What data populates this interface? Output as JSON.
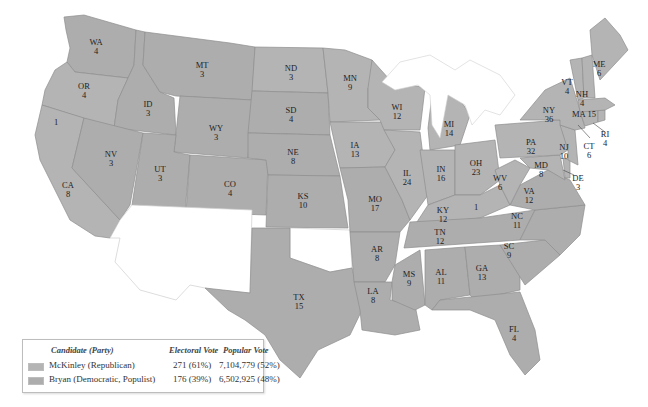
{
  "map": {
    "title": "1896 Presidential Election Electoral Map",
    "colors": {
      "mckinley": "#b4b4b4",
      "bryan": "#adadad",
      "territory": "#ffffff",
      "label": "#222222"
    },
    "states": [
      {
        "abbr": "WA",
        "ev": "4",
        "winner": "bryan"
      },
      {
        "abbr": "OR",
        "ev": "4",
        "winner": "mckinley"
      },
      {
        "abbr": "CA",
        "ev": "8",
        "winner": "mckinley"
      },
      {
        "abbr": "CA-split",
        "ev": "1",
        "winner": "bryan"
      },
      {
        "abbr": "ID",
        "ev": "3",
        "winner": "bryan"
      },
      {
        "abbr": "NV",
        "ev": "3",
        "winner": "bryan"
      },
      {
        "abbr": "MT",
        "ev": "3",
        "winner": "bryan"
      },
      {
        "abbr": "WY",
        "ev": "3",
        "winner": "bryan"
      },
      {
        "abbr": "UT",
        "ev": "3",
        "winner": "bryan"
      },
      {
        "abbr": "CO",
        "ev": "4",
        "winner": "bryan"
      },
      {
        "abbr": "ND",
        "ev": "3",
        "winner": "mckinley"
      },
      {
        "abbr": "SD",
        "ev": "4",
        "winner": "bryan"
      },
      {
        "abbr": "NE",
        "ev": "8",
        "winner": "bryan"
      },
      {
        "abbr": "KS",
        "ev": "10",
        "winner": "bryan"
      },
      {
        "abbr": "TX",
        "ev": "15",
        "winner": "bryan"
      },
      {
        "abbr": "MN",
        "ev": "9",
        "winner": "mckinley"
      },
      {
        "abbr": "IA",
        "ev": "13",
        "winner": "mckinley"
      },
      {
        "abbr": "MO",
        "ev": "17",
        "winner": "bryan"
      },
      {
        "abbr": "AR",
        "ev": "8",
        "winner": "bryan"
      },
      {
        "abbr": "LA",
        "ev": "8",
        "winner": "bryan"
      },
      {
        "abbr": "WI",
        "ev": "12",
        "winner": "mckinley"
      },
      {
        "abbr": "IL",
        "ev": "24",
        "winner": "mckinley"
      },
      {
        "abbr": "MI",
        "ev": "14",
        "winner": "mckinley"
      },
      {
        "abbr": "IN",
        "ev": "16",
        "winner": "mckinley"
      },
      {
        "abbr": "OH",
        "ev": "23",
        "winner": "mckinley"
      },
      {
        "abbr": "KY",
        "ev": "12",
        "winner": "mckinley"
      },
      {
        "abbr": "KY-split",
        "ev": "1",
        "winner": "bryan"
      },
      {
        "abbr": "TN",
        "ev": "12",
        "winner": "bryan"
      },
      {
        "abbr": "MS",
        "ev": "9",
        "winner": "bryan"
      },
      {
        "abbr": "AL",
        "ev": "11",
        "winner": "bryan"
      },
      {
        "abbr": "GA",
        "ev": "13",
        "winner": "bryan"
      },
      {
        "abbr": "FL",
        "ev": "4",
        "winner": "bryan"
      },
      {
        "abbr": "SC",
        "ev": "9",
        "winner": "bryan"
      },
      {
        "abbr": "NC",
        "ev": "11",
        "winner": "bryan"
      },
      {
        "abbr": "VA",
        "ev": "12",
        "winner": "bryan"
      },
      {
        "abbr": "WV",
        "ev": "6",
        "winner": "mckinley"
      },
      {
        "abbr": "MD",
        "ev": "8",
        "winner": "mckinley"
      },
      {
        "abbr": "DE",
        "ev": "3",
        "winner": "mckinley"
      },
      {
        "abbr": "PA",
        "ev": "32",
        "winner": "mckinley"
      },
      {
        "abbr": "NJ",
        "ev": "10",
        "winner": "mckinley"
      },
      {
        "abbr": "NY",
        "ev": "36",
        "winner": "mckinley"
      },
      {
        "abbr": "CT",
        "ev": "6",
        "winner": "mckinley"
      },
      {
        "abbr": "RI",
        "ev": "4",
        "winner": "mckinley"
      },
      {
        "abbr": "MA",
        "ev": "15",
        "winner": "mckinley"
      },
      {
        "abbr": "VT",
        "ev": "4",
        "winner": "mckinley"
      },
      {
        "abbr": "NH",
        "ev": "4",
        "winner": "mckinley"
      },
      {
        "abbr": "ME",
        "ev": "6",
        "winner": "mckinley"
      }
    ]
  },
  "legend": {
    "headers": {
      "candidate": "Candidate (Party)",
      "electoral": "Electoral Vote",
      "popular": "Popular Vote"
    },
    "rows": [
      {
        "candidate": "McKinley (Republican)",
        "electoral": "271 (61%)",
        "popular": "7,104,779 (52%)",
        "swatch": "#b4b4b4"
      },
      {
        "candidate": "Bryan (Democratic, Populist)",
        "electoral": "176 (39%)",
        "popular": "6,502,925 (48%)",
        "swatch": "#adadad"
      }
    ]
  }
}
